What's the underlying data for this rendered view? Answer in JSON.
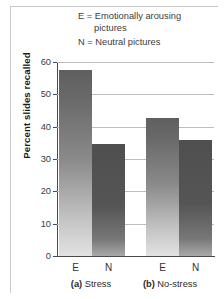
{
  "legend": {
    "line1_main": "E = Emotionally arousing",
    "line1_cont": "pictures",
    "line2": "N = Neutral pictures"
  },
  "axes": {
    "ylabel": "Percent slides recalled",
    "yticks": [
      "0",
      "10",
      "20",
      "30",
      "40",
      "50",
      "60"
    ]
  },
  "xticks": {
    "a_e": "E",
    "a_n": "N",
    "b_e": "E",
    "b_n": "N"
  },
  "groups": {
    "a_tag": "(a)",
    "a_name": "Stress",
    "b_tag": "(b)",
    "b_name": "No-stress"
  },
  "colors": {
    "bar_e_top": "#5f5f5f",
    "bar_e_bottom": "#e2e2e2",
    "bar_n_top": "#4f4f4f",
    "bar_n_bottom": "#a9a9a9",
    "gridline": "#bdbdbd",
    "axis": "#4a4a4a",
    "frame": "#c9c9c9",
    "text": "#333333"
  },
  "chart_data": {
    "type": "bar",
    "title": "",
    "xlabel": "",
    "ylabel": "Percent slides recalled",
    "ylim": [
      0,
      60
    ],
    "ytick_step": 10,
    "grid": true,
    "legend_position": "top",
    "categories": [
      "(a) Stress",
      "(b) No-stress"
    ],
    "series": [
      {
        "name": "E = Emotionally arousing pictures",
        "values": [
          57.5,
          42.7
        ]
      },
      {
        "name": "N = Neutral pictures",
        "values": [
          34.7,
          36.0
        ]
      }
    ],
    "bars": [
      {
        "group": "(a) Stress",
        "condition": "E",
        "value": 57.5
      },
      {
        "group": "(a) Stress",
        "condition": "N",
        "value": 34.7
      },
      {
        "group": "(b) No-stress",
        "condition": "E",
        "value": 42.7
      },
      {
        "group": "(b) No-stress",
        "condition": "N",
        "value": 36.0
      }
    ]
  }
}
